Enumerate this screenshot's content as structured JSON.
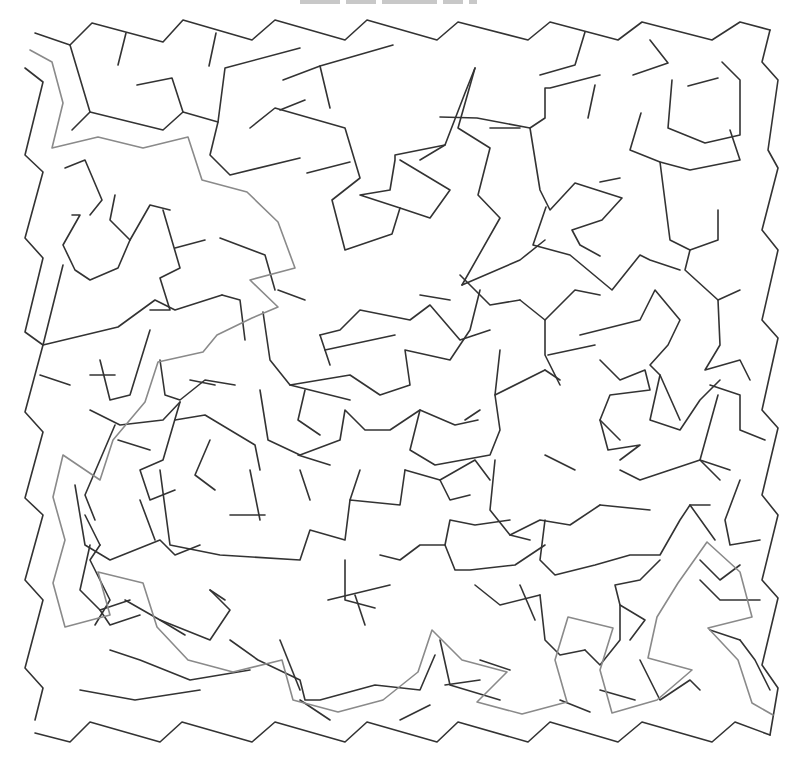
{
  "title": {
    "text_visible": "",
    "note": "clipped title text at top edge, illegible"
  },
  "maze": {
    "type": "irregular polygonal maze",
    "wall_color": "#333333",
    "solution_color": "#8a8a8a",
    "background_color": "#ffffff",
    "solution_path": [
      [
        30,
        50
      ],
      [
        52,
        62
      ],
      [
        63,
        103
      ],
      [
        52,
        148
      ],
      [
        98,
        137
      ],
      [
        143,
        148
      ],
      [
        188,
        137
      ],
      [
        202,
        180
      ],
      [
        247,
        192
      ],
      [
        278,
        222
      ],
      [
        295,
        268
      ],
      [
        250,
        280
      ],
      [
        278,
        307
      ],
      [
        252,
        318
      ],
      [
        217,
        335
      ],
      [
        203,
        352
      ],
      [
        158,
        362
      ],
      [
        145,
        402
      ],
      [
        113,
        440
      ],
      [
        100,
        480
      ],
      [
        63,
        455
      ],
      [
        53,
        497
      ],
      [
        65,
        540
      ],
      [
        53,
        583
      ],
      [
        65,
        627
      ],
      [
        110,
        615
      ],
      [
        98,
        572
      ],
      [
        143,
        583
      ],
      [
        157,
        627
      ],
      [
        188,
        660
      ],
      [
        233,
        672
      ],
      [
        282,
        660
      ],
      [
        293,
        700
      ],
      [
        338,
        712
      ],
      [
        383,
        700
      ],
      [
        418,
        672
      ],
      [
        432,
        630
      ],
      [
        462,
        660
      ],
      [
        507,
        672
      ],
      [
        477,
        702
      ],
      [
        522,
        714
      ],
      [
        567,
        702
      ],
      [
        555,
        660
      ],
      [
        568,
        617
      ],
      [
        613,
        628
      ],
      [
        600,
        670
      ],
      [
        612,
        713
      ],
      [
        657,
        700
      ],
      [
        692,
        670
      ],
      [
        648,
        658
      ],
      [
        657,
        617
      ],
      [
        678,
        583
      ],
      [
        707,
        542
      ],
      [
        740,
        572
      ],
      [
        752,
        617
      ],
      [
        708,
        628
      ],
      [
        738,
        660
      ],
      [
        752,
        703
      ],
      [
        773,
        715
      ]
    ]
  }
}
